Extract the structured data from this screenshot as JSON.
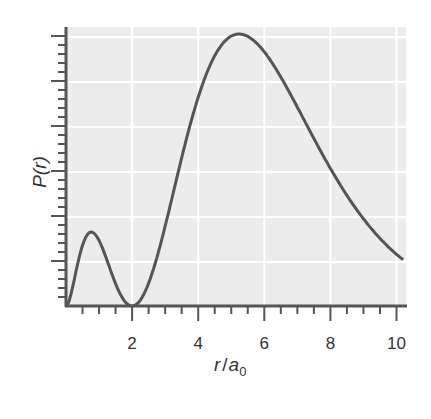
{
  "chart_data": {
    "type": "line",
    "title": "",
    "xlabel": "r/a0",
    "ylabel": "P(r)",
    "xlim": [
      0,
      10.3
    ],
    "ylim": [
      0,
      1.56
    ],
    "x_ticks": [
      2,
      4,
      6,
      8,
      10
    ],
    "x_tick_labels": [
      "2",
      "4",
      "6",
      "8",
      "10"
    ],
    "y_tick_labels": [],
    "grid": true,
    "legend": null,
    "series": [
      {
        "name": "P(r)",
        "x": [
          0,
          0.25,
          0.5,
          0.76,
          1.0,
          1.25,
          1.5,
          1.75,
          2.0,
          2.5,
          3.0,
          3.5,
          4.0,
          4.5,
          5.0,
          5.24,
          5.5,
          6.0,
          6.5,
          7.0,
          7.5,
          8.0,
          8.5,
          9.0,
          9.5,
          10.0,
          10.2
        ],
        "y": [
          0,
          0.171,
          0.341,
          0.416,
          0.368,
          0.25,
          0.125,
          0.033,
          0,
          0.128,
          0.448,
          0.83,
          1.172,
          1.416,
          1.516,
          1.528,
          1.508,
          1.388,
          1.198,
          0.958,
          0.766,
          0.604,
          0.437,
          0.307,
          0.195,
          0.136,
          0.119
        ]
      }
    ]
  },
  "labels": {
    "xlabel_r": "r",
    "xlabel_slash": "/",
    "xlabel_a": "a",
    "xlabel_sub": "0",
    "ylabel": "P(r)"
  },
  "colors": {
    "plot_bg": "#ececec",
    "grid": "#ffffff",
    "curve": "#555555",
    "axis": "#555555"
  }
}
